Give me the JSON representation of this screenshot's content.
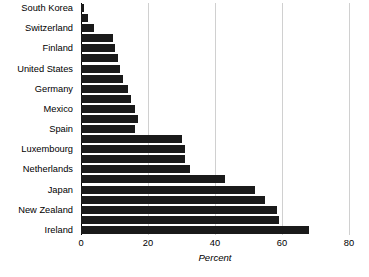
{
  "chart_data": {
    "type": "bar",
    "orientation": "horizontal",
    "title": "",
    "xlabel": "Percent",
    "ylabel": "",
    "xlim": [
      0,
      80
    ],
    "xticks": [
      0,
      20,
      40,
      60,
      80
    ],
    "grid": true,
    "legend": null,
    "bar_color": "#1a1a1a",
    "gridline_color": "#d0d0d0",
    "axis_color": "#000000",
    "label_every_nth": 2,
    "categories": [
      "South Korea",
      "",
      "Switzerland",
      "",
      "Finland",
      "",
      "United States",
      "",
      "Germany",
      "",
      "Mexico",
      "",
      "Spain",
      "",
      "Luxembourg",
      "",
      "Netherlands",
      "",
      "Japan",
      "",
      "New Zealand",
      "",
      "Ireland"
    ],
    "values": [
      1,
      2,
      4,
      9.5,
      10,
      11,
      11.5,
      12.5,
      14,
      15,
      16,
      17,
      16,
      30,
      31,
      31,
      32.5,
      43,
      52,
      55,
      58.5,
      59,
      68
    ],
    "visible_labels": [
      "South Korea",
      "Switzerland",
      "Finland",
      "United States",
      "Germany",
      "Mexico",
      "Spain",
      "Luxembourg",
      "Netherlands",
      "Japan",
      "New Zealand",
      "Ireland"
    ]
  }
}
